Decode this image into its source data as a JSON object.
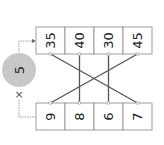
{
  "diagram": {
    "multiplier": {
      "value": "5",
      "operator": "×"
    },
    "top_row": [
      "35",
      "40",
      "30",
      "45"
    ],
    "bottom_row": [
      "9",
      "8",
      "6",
      "7"
    ],
    "connections": [
      {
        "bottom": "9",
        "top": "45"
      },
      {
        "bottom": "8",
        "top": "40"
      },
      {
        "bottom": "6",
        "top": "30"
      },
      {
        "bottom": "7",
        "top": "35"
      }
    ],
    "colors": {
      "circle": "#c8c8c8",
      "lines": "#555555",
      "box_border": "#888888"
    }
  }
}
